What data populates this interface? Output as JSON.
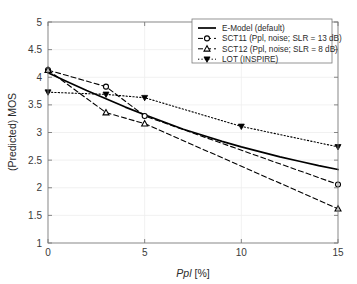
{
  "chart_data": {
    "type": "line",
    "title": "",
    "xlabel": "Ppl [%]",
    "xlabel_italic_part": "Ppl",
    "xlabel_rest": " [%]",
    "ylabel": "(Predicted) MOS",
    "xlim": [
      0,
      15
    ],
    "ylim": [
      1,
      5
    ],
    "xticks": [
      0,
      5,
      10,
      15
    ],
    "xtick_labels": [
      "0",
      "5",
      "10",
      "15"
    ],
    "yticks": [
      1,
      1.5,
      2,
      2.5,
      3,
      3.5,
      4,
      4.5,
      5
    ],
    "ytick_labels": [
      "1",
      "1.5",
      "2",
      "2.5",
      "3",
      "3.5",
      "4",
      "4.5",
      "5"
    ],
    "grid": true,
    "legend_position": "top-right",
    "series": [
      {
        "name": "E-Model (default)",
        "style": "solid",
        "marker": "none",
        "color": "#000000",
        "x": [
          0,
          1,
          2,
          3,
          4,
          5,
          6,
          7,
          8,
          9,
          10,
          11,
          12,
          13,
          14,
          15
        ],
        "y": [
          4.08,
          3.92,
          3.76,
          3.61,
          3.46,
          3.32,
          3.19,
          3.06,
          2.95,
          2.84,
          2.74,
          2.65,
          2.56,
          2.48,
          2.4,
          2.33
        ]
      },
      {
        "name": "SCT11 (Ppl, noise; SLR = 13 dB)",
        "style": "dashed",
        "marker": "circle",
        "color": "#000000",
        "x": [
          0,
          3,
          5,
          15
        ],
        "y": [
          4.13,
          3.83,
          3.3,
          2.06
        ]
      },
      {
        "name": "SCT12 (Ppl, noise; SLR = 8 dB)",
        "style": "dashed",
        "marker": "triangle-up",
        "color": "#000000",
        "x": [
          0,
          3,
          5,
          15
        ],
        "y": [
          4.13,
          3.36,
          3.16,
          1.62
        ]
      },
      {
        "name": "LOT (INSPIRE)",
        "style": "dotted",
        "marker": "triangle-down-filled",
        "color": "#000000",
        "x": [
          0,
          3,
          5,
          10,
          15
        ],
        "y": [
          3.73,
          3.69,
          3.63,
          3.11,
          2.74
        ]
      }
    ],
    "legend_entries": [
      {
        "label": "E-Model (default)",
        "style": "solid",
        "marker": "none"
      },
      {
        "label": "SCT11 (Ppl, noise; SLR = 13 dB)",
        "style": "dashed",
        "marker": "circle"
      },
      {
        "label": "SCT12 (Ppl, noise; SLR = 8 dB)",
        "style": "dashed",
        "marker": "triangle-up"
      },
      {
        "label": "LOT (INSPIRE)",
        "style": "dotted",
        "marker": "triangle-down-filled"
      }
    ]
  },
  "colors": {
    "axis": "#7a7a7a",
    "grid": "#eeeeee",
    "series": "#000000",
    "text": "#2b2b2b",
    "background": "#ffffff"
  }
}
